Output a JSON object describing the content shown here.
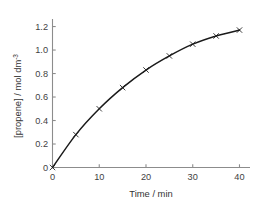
{
  "chart_data": {
    "type": "line",
    "title": "",
    "subtitle": "",
    "xlabel": "Time / min",
    "ylabel": "[propene] / mol dm",
    "ylabel_superscript": "-3",
    "ylabel_full": "[propene] / mol dm-3",
    "x": [
      0,
      5,
      10,
      15,
      20,
      25,
      30,
      35,
      40
    ],
    "values": [
      0,
      0.28,
      0.5,
      0.68,
      0.83,
      0.95,
      1.05,
      1.12,
      1.17
    ],
    "series": [
      {
        "name": "propene concentration",
        "values": [
          0,
          0.28,
          0.5,
          0.68,
          0.83,
          0.95,
          1.05,
          1.12,
          1.17
        ]
      }
    ],
    "xlim": [
      0,
      41.5
    ],
    "ylim": [
      0,
      1.26
    ],
    "xticks": [
      0,
      10,
      20,
      30,
      40
    ],
    "xtick_labels": [
      "0",
      "10",
      "20",
      "30",
      "40"
    ],
    "yticks": [
      0,
      0.2,
      0.4,
      0.6,
      0.8,
      1.0,
      1.2
    ],
    "ytick_labels": [
      "0",
      "0.2",
      "0.4",
      "0.6",
      "0.8",
      "1.0",
      "1.2"
    ],
    "grid": false,
    "legend": false,
    "legend_position": "none",
    "marker": "x",
    "marker_label": "cross-marker",
    "annotations": [],
    "colors": {
      "curve": "#1a1a1a",
      "marker": "#1a1a1a",
      "axis": "#8c8c8c",
      "tick_label": "#3f3f3f",
      "axis_title": "#333333",
      "background": "#ffffff"
    }
  }
}
